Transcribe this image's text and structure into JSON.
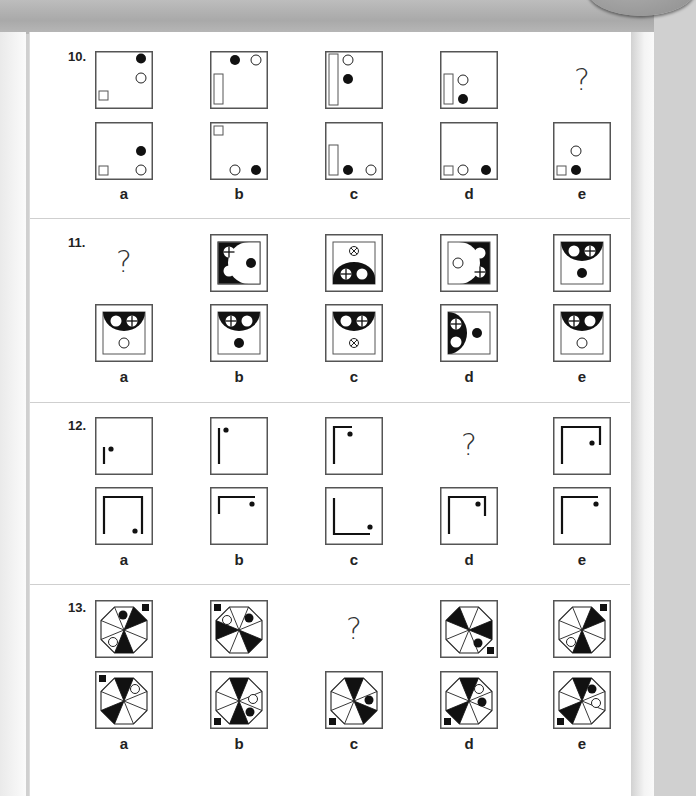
{
  "page": {
    "colors": {
      "page_bg": "#ffffff",
      "ink": "#111111",
      "frame": "#555555",
      "divider": "#cfcfcf"
    }
  },
  "questions": [
    {
      "number": "10.",
      "top_row": [
        {
          "col": 0,
          "type": "figure",
          "desc": "square at bottom-left, open circle upper-right, filled circle top-right"
        },
        {
          "col": 1,
          "type": "figure",
          "desc": "filled circle and open circle at top, tall rectangle at left"
        },
        {
          "col": 2,
          "type": "figure",
          "desc": "tall rectangle full height at left, open circle top, filled circle below"
        },
        {
          "col": 3,
          "type": "figure",
          "desc": "short rectangle at left, open circle above filled circle"
        },
        {
          "col": 4,
          "type": "question",
          "text": "?"
        }
      ],
      "options": [
        {
          "label": "a",
          "desc": "square bottom-left, open circle bottom-right, filled circle above it"
        },
        {
          "label": "b",
          "desc": "square top-left, open circle and filled circle bottom-right"
        },
        {
          "label": "c",
          "desc": "rectangle bottom-left, filled circle then open circle bottom"
        },
        {
          "label": "d",
          "desc": "square, open circle, filled circle along bottom"
        },
        {
          "label": "e",
          "desc": "square and filled circle at bottom-left, open circle above"
        }
      ]
    },
    {
      "number": "11.",
      "top_row": [
        {
          "col": 0,
          "type": "question",
          "text": "?"
        },
        {
          "col": 1,
          "type": "figure",
          "desc": "black field with white half-disc on right containing black dot; crossed circle and open circle on left"
        },
        {
          "col": 2,
          "type": "figure",
          "desc": "black half-disc at bottom with crossed circle and open circle; x-circle on top"
        },
        {
          "col": 3,
          "type": "figure",
          "desc": "black field with white half-disc on left containing open circle; open circle and crossed circle on right"
        },
        {
          "col": 4,
          "type": "figure",
          "desc": "black half-disc at top with open circle and crossed circle; filled dot below"
        }
      ],
      "options": [
        {
          "label": "a",
          "desc": "half-disc top with open circle, crossed circle; open circle below"
        },
        {
          "label": "b",
          "desc": "half-disc top with crossed circle, open circle; filled dot below"
        },
        {
          "label": "c",
          "desc": "half-disc top with open circle, crossed circle; x-circle below"
        },
        {
          "label": "d",
          "desc": "half-disc left with crossed circle, open circle; filled dot right"
        },
        {
          "label": "e",
          "desc": "half-disc top with crossed circle, open circle; open circle below"
        }
      ]
    },
    {
      "number": "12.",
      "top_row": [
        {
          "col": 0,
          "type": "figure",
          "desc": "short vertical bar with dot"
        },
        {
          "col": 1,
          "type": "figure",
          "desc": "long vertical bar with dot"
        },
        {
          "col": 2,
          "type": "figure",
          "desc": "vertical bar with short top arm, dot"
        },
        {
          "col": 3,
          "type": "question",
          "text": "?"
        },
        {
          "col": 4,
          "type": "figure",
          "desc": "inverted U with short right leg, dot inside"
        }
      ],
      "options": [
        {
          "label": "a",
          "desc": "full inverted U, dot bottom right"
        },
        {
          "label": "b",
          "desc": "short vertical with long top arm, dot at right"
        },
        {
          "label": "c",
          "desc": "L shape, dot bottom right"
        },
        {
          "label": "d",
          "desc": "inverted U with short right leg, dot inside"
        },
        {
          "label": "e",
          "desc": "vertical with long top arm, dot right"
        }
      ]
    },
    {
      "number": "13.",
      "top_row": [
        {
          "col": 0,
          "type": "figure",
          "desc": "octagon, square top-right"
        },
        {
          "col": 1,
          "type": "figure",
          "desc": "octagon, square top-left"
        },
        {
          "col": 2,
          "type": "question",
          "text": "?"
        },
        {
          "col": 3,
          "type": "figure",
          "desc": "octagon, square bottom-right"
        },
        {
          "col": 4,
          "type": "figure",
          "desc": "octagon, square top-right"
        }
      ],
      "options": [
        {
          "label": "a",
          "desc": "octagon, square top-left"
        },
        {
          "label": "b",
          "desc": "octagon, square bottom-left"
        },
        {
          "label": "c",
          "desc": "octagon, square bottom-left"
        },
        {
          "label": "d",
          "desc": "octagon, square bottom-left"
        },
        {
          "label": "e",
          "desc": "octagon, square bottom-left"
        }
      ]
    }
  ]
}
